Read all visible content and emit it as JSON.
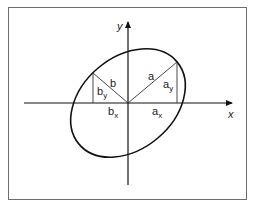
{
  "diagram": {
    "colors": {
      "background": "#ffffff",
      "frame": "#6e6e6e",
      "stroke": "#111111",
      "text": "#222222"
    },
    "axes": {
      "x_label": "x",
      "y_label": "y"
    },
    "labels": {
      "a": "a",
      "b": "b",
      "a_x_base": "a",
      "a_x_sub": "x",
      "a_y_base": "a",
      "a_y_sub": "y",
      "b_x_base": "b",
      "b_x_sub": "x",
      "b_y_base": "b",
      "b_y_sub": "y"
    },
    "geometry": {
      "origin": [
        128,
        103
      ],
      "semi_major_a": 64,
      "semi_minor_b": 46,
      "rotation_deg": -40,
      "point_a": [
        177,
        62
      ],
      "point_b": [
        93,
        73
      ]
    }
  }
}
